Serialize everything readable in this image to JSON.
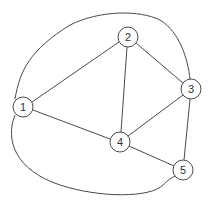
{
  "diagram": {
    "type": "undirected-graph",
    "node_radius": 10,
    "nodes": [
      {
        "id": "1",
        "label": "1",
        "x": 23,
        "y": 107
      },
      {
        "id": "2",
        "label": "2",
        "x": 128,
        "y": 37
      },
      {
        "id": "3",
        "label": "3",
        "x": 191,
        "y": 89
      },
      {
        "id": "4",
        "label": "4",
        "x": 120,
        "y": 142
      },
      {
        "id": "5",
        "label": "5",
        "x": 183,
        "y": 170
      }
    ],
    "edges": [
      {
        "from": "1",
        "to": "2",
        "style": "straight"
      },
      {
        "from": "1",
        "to": "4",
        "style": "straight"
      },
      {
        "from": "2",
        "to": "3",
        "style": "straight"
      },
      {
        "from": "2",
        "to": "4",
        "style": "straight"
      },
      {
        "from": "3",
        "to": "4",
        "style": "straight"
      },
      {
        "from": "3",
        "to": "5",
        "style": "straight"
      },
      {
        "from": "4",
        "to": "5",
        "style": "straight"
      },
      {
        "from": "1",
        "to": "3",
        "style": "curved-top"
      },
      {
        "from": "1",
        "to": "5",
        "style": "curved-bottom"
      }
    ],
    "colors": {
      "stroke": "#4a4a4a",
      "node_fill": "#ffffff",
      "label": "#333333",
      "background": "#ffffff"
    }
  }
}
